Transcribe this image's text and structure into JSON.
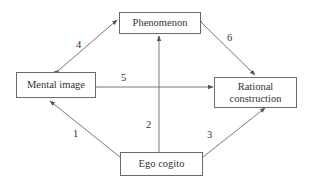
{
  "diagram": {
    "nodes": {
      "phenomenon": "Phenomenon",
      "mental_image": "Mental image",
      "rational_construction_line1": "Rational",
      "rational_construction_line2": "construction",
      "ego_cogito": "Ego cogito"
    },
    "edges": [
      {
        "id": "1",
        "label": "1",
        "from": "Ego cogito",
        "to": "Mental image",
        "direction": "single"
      },
      {
        "id": "2",
        "label": "2",
        "from": "Ego cogito",
        "to": "Phenomenon",
        "direction": "single"
      },
      {
        "id": "3",
        "label": "3",
        "from": "Ego cogito",
        "to": "Rational construction",
        "direction": "single"
      },
      {
        "id": "4",
        "label": "4",
        "from": "Mental image",
        "to": "Phenomenon",
        "direction": "bidirectional"
      },
      {
        "id": "5",
        "label": "5",
        "from": "Mental image",
        "to": "Rational construction",
        "direction": "bidirectional"
      },
      {
        "id": "6",
        "label": "6",
        "from": "Phenomenon",
        "to": "Rational construction",
        "direction": "bidirectional"
      }
    ],
    "colors": {
      "line": "#555555",
      "text": "#333333",
      "background": "#ffffff"
    }
  }
}
